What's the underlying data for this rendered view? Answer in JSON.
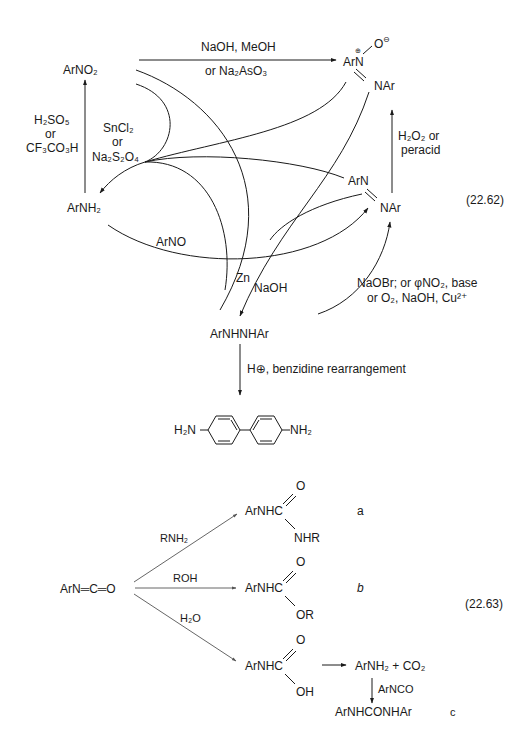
{
  "equation_1": {
    "number": "(22.62)",
    "species": {
      "nitro": "ArNO₂",
      "amine": "ArNH₂",
      "azoxy_top_left": "ArN",
      "azoxy_plus": "⊕",
      "azoxy_oxygen": "O",
      "azoxy_minus": "⊖",
      "azoxy_bottom": "NAr",
      "azo_top": "ArN",
      "azo_bottom": "NAr",
      "hydrazo": "ArNHNHAr",
      "benzidine_left": "H₂N",
      "benzidine_right": "NH₂"
    },
    "reagents": {
      "nitro_to_azoxy_line1": "NaOH, MeOH",
      "nitro_to_azoxy_line2": "or Na₂AsO₃",
      "amine_to_nitro_line1": "H₂SO₅",
      "amine_to_nitro_line2": "or",
      "amine_to_nitro_line3": "CF₃CO₃H",
      "reduction_line1": "SnCl₂",
      "reduction_line2": "or",
      "reduction_line3": "Na₂S₂O₄",
      "azo_to_azoxy_line1": "H₂O₂ or",
      "azo_to_azoxy_line2": "peracid",
      "amine_to_azo": "ArNO",
      "zn": "Zn",
      "naoh": "NaOH",
      "hydrazo_to_azo_line1": "NaOBr; or φNO₂, base",
      "hydrazo_to_azo_line2": "or O₂, NaOH, Cu²⁺",
      "benzidine": "H⊕, benzidine rearrangement"
    }
  },
  "equation_2": {
    "number": "(22.63)",
    "reactant": "ArN═C═O",
    "branches": [
      {
        "reagent": "RNH₂",
        "product_core": "ArNHC",
        "product_o": "O",
        "product_sub": "NHR",
        "label": "a"
      },
      {
        "reagent": "ROH",
        "product_core": "ArNHC",
        "product_o": "O",
        "product_sub": "OR",
        "label": "b"
      },
      {
        "reagent": "H₂O",
        "product_core": "ArNHC",
        "product_o": "O",
        "product_sub": "OH",
        "label": "c"
      }
    ],
    "decomposition": {
      "products": "ArNH₂ + CO₂",
      "reagent": "ArNCO",
      "final": "ArNHCONHAr"
    }
  }
}
